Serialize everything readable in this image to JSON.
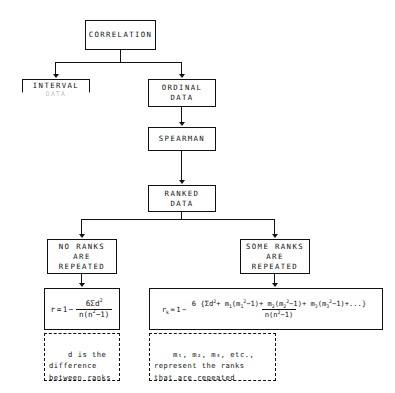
{
  "diagram": {
    "root": {
      "label": "CORRELATION"
    },
    "branches": {
      "left": {
        "label": "INTERVAL",
        "faded_label": "DATA"
      },
      "right": {
        "label": "ORDINAL\nDATA"
      }
    },
    "method": {
      "label": "SPEARMAN"
    },
    "ranked": {
      "label": "RANKED\nDATA"
    },
    "cases": {
      "no_ties": {
        "label": "NO RANKS\nARE\nREPEATED"
      },
      "ties": {
        "label": "SOME RANKS\nARE\nREPEATED"
      }
    },
    "formulas": {
      "no_ties": {
        "lhs": "r",
        "equals": "=",
        "one": "1",
        "minus": "−",
        "numerator": "6Σd",
        "numerator_exp": "2",
        "denominator_a": "n(n",
        "denominator_exp": "2",
        "denominator_b": "−1)",
        "plain": "r = 1 − 6Σd² / n(n²−1)"
      },
      "ties": {
        "lhs": "r",
        "lhs_sub": "k",
        "equals": "=",
        "one": "1",
        "minus": "−",
        "num_lead": "6 {Σd",
        "num_lead_exp": "2",
        "num_t1_a": "+ m",
        "num_t1_sub": "1",
        "num_t1_b": "(m",
        "num_t1_sub2": "1",
        "num_t1_exp": "2",
        "num_t1_c": "−1)",
        "num_t2_a": "+ m",
        "num_t2_sub": "2",
        "num_t2_b": "(m",
        "num_t2_sub2": "2",
        "num_t2_exp": "2",
        "num_t2_c": "−1)",
        "num_t3_a": "+ m",
        "num_t3_sub": "3",
        "num_t3_b": "(m",
        "num_t3_sub2": "3",
        "num_t3_exp": "2",
        "num_t3_c": "−1)",
        "num_tail": "+...}",
        "denominator_a": "n(n",
        "denominator_exp": "2",
        "denominator_b": "−1)",
        "plain": "r_k = 1 − 6{Σd² + m₁(m₁²−1) + m₂(m₂²−1) + m₃(m₃²−1)+...} / n(n²−1)"
      }
    },
    "notes": {
      "left": "d is the\ndifference\nbetween ranks",
      "right": "m₁, m₂, m₃, etc.,\nrepresent the ranks\nthat are repeated"
    }
  },
  "style": {
    "ink": "#111111",
    "paper": "#ffffff",
    "faded_ink": "#8e8e8e"
  }
}
